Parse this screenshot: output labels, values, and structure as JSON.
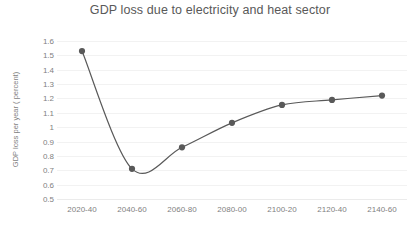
{
  "chart_data": {
    "type": "line",
    "title": "GDP loss due to electricity and heat sector",
    "xlabel": "",
    "ylabel": "GDP loss per year ( percent)",
    "categories": [
      "2020-40",
      "2040-60",
      "2060-80",
      "2080-00",
      "2100-20",
      "2120-40",
      "2140-60"
    ],
    "values": [
      1.53,
      0.71,
      0.86,
      1.03,
      1.155,
      1.19,
      1.22
    ],
    "yticks": [
      0.5,
      0.6,
      0.7,
      0.8,
      0.9,
      1,
      1.1,
      1.2,
      1.3,
      1.4,
      1.5,
      1.6
    ],
    "ytick_labels": [
      "0.5",
      "0.6",
      "0.7",
      "0.8",
      "0.9",
      "1",
      "1.1",
      "1.2",
      "1.3",
      "1.4",
      "1.5",
      "1.6"
    ],
    "ylim": [
      0.5,
      1.6
    ],
    "grid": true,
    "legend": false,
    "smooth": true,
    "markers": true,
    "series_color": "#595959",
    "grid_color": "#f2f2f2",
    "text_color": "#7f7f7f",
    "title_color": "#595959"
  }
}
